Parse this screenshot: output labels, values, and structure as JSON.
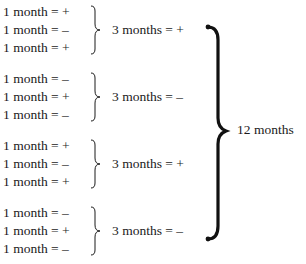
{
  "groups": [
    {
      "months": [
        {
          "label": "1 month =",
          "sign": "+"
        },
        {
          "label": "1 month =",
          "sign": "–"
        },
        {
          "label": "1 month =",
          "sign": "+"
        }
      ],
      "summary": {
        "label": "3 months =",
        "sign": "+"
      }
    },
    {
      "months": [
        {
          "label": "1 month =",
          "sign": "–"
        },
        {
          "label": "1 month =",
          "sign": "+"
        },
        {
          "label": "1 month =",
          "sign": "–"
        }
      ],
      "summary": {
        "label": "3 months =",
        "sign": "–"
      }
    },
    {
      "months": [
        {
          "label": "1 month =",
          "sign": "+"
        },
        {
          "label": "1 month =",
          "sign": "–"
        },
        {
          "label": "1 month =",
          "sign": "+"
        }
      ],
      "summary": {
        "label": "3 months =",
        "sign": "+"
      }
    },
    {
      "months": [
        {
          "label": "1 month =",
          "sign": "–"
        },
        {
          "label": "1 month =",
          "sign": "+"
        },
        {
          "label": "1 month =",
          "sign": "–"
        }
      ],
      "summary": {
        "label": "3 months =",
        "sign": "–"
      }
    }
  ],
  "total": {
    "label": "12 months"
  }
}
